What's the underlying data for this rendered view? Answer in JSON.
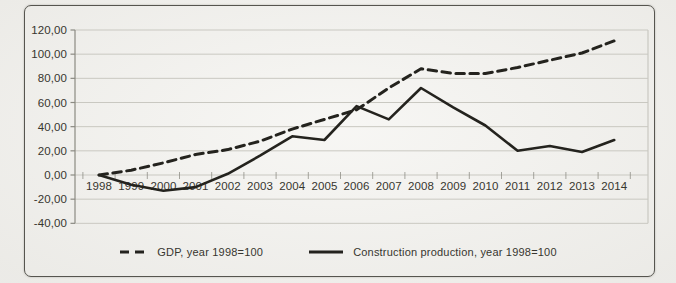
{
  "figure": {
    "kind": "scanned line chart, no title",
    "background": "#f3f2ee"
  },
  "chart_data": {
    "type": "line",
    "title": "",
    "xlabel": "",
    "ylabel": "",
    "x": [
      "1998",
      "1999",
      "2000",
      "2001",
      "2002",
      "2003",
      "2004",
      "2005",
      "2006",
      "2007",
      "2008",
      "2009",
      "2010",
      "2011",
      "2012",
      "2013",
      "2014"
    ],
    "series": [
      {
        "name": "GDP, year 1998=100",
        "line_style": "dashed",
        "values": [
          0,
          4,
          10,
          17,
          21,
          28,
          38,
          46,
          54,
          72,
          88,
          84,
          84,
          89,
          95,
          101,
          111
        ]
      },
      {
        "name": "Construction production, year 1998=100",
        "line_style": "solid",
        "values": [
          0,
          -8,
          -13,
          -10,
          1,
          16,
          32,
          29,
          57,
          46,
          72,
          56,
          41,
          20,
          24,
          19,
          29
        ]
      }
    ],
    "ylim": [
      -40,
      120
    ],
    "ytick_step": 20,
    "ytick_labels": [
      "120,00",
      "100,00",
      "80,00",
      "60,00",
      "40,00",
      "20,00",
      "0,00",
      "-20,00",
      "-40,00"
    ],
    "grid": "horizontal",
    "legend_position": "bottom-center"
  },
  "colors": {
    "paper": "#f3f2ee",
    "frame": "#56554f",
    "grid": "#c9c8c1",
    "axis": "#8b8a82",
    "line_ink": "#24231e",
    "text": "#37362f"
  }
}
